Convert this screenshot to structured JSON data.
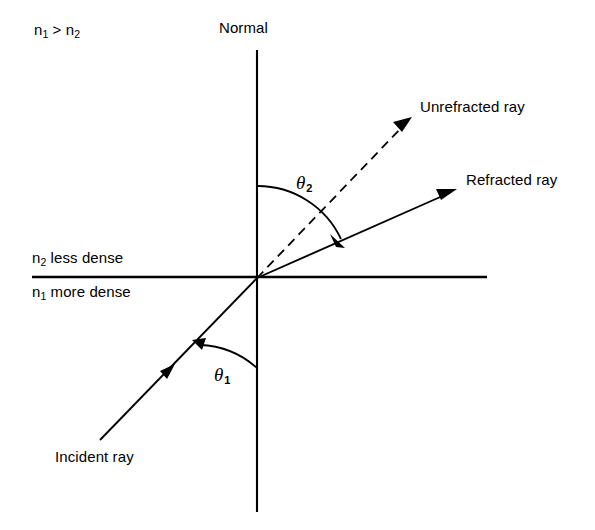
{
  "figure": {
    "background_color": "#ffffff",
    "stroke_color": "#000000",
    "width": 595,
    "height": 530
  },
  "labels": {
    "index_relation": "n₁ > n₂",
    "index_relation_base": "n",
    "index_relation_sub1": "1",
    "index_relation_middle": " > n",
    "index_relation_sub2": "2",
    "normal": "Normal",
    "upper_medium": "less dense",
    "upper_medium_symbol": "n",
    "upper_medium_sub": "2",
    "lower_medium": "more dense",
    "lower_medium_symbol": "n",
    "lower_medium_sub": "1",
    "unrefracted_ray": "Unrefracted ray",
    "refracted_ray": "Refracted ray",
    "incident_ray": "Incident ray",
    "theta2_symbol": "θ",
    "theta2_sub": "2",
    "theta1_symbol": "θ",
    "theta1_sub": "1"
  },
  "geometry": {
    "origin": {
      "x": 257,
      "y": 278
    },
    "normal_line": {
      "x1": 257,
      "y1": 50,
      "x2": 257,
      "y2": 512
    },
    "interface_line": {
      "x1": 32,
      "y1": 277,
      "x2": 487,
      "y2": 277
    },
    "incident_ray": {
      "x1": 100,
      "y1": 440,
      "x2": 257,
      "y2": 278,
      "style": "solid",
      "mid_arrow_at": {
        "x": 170,
        "y": 370
      }
    },
    "unrefracted_ray": {
      "x1": 257,
      "y1": 278,
      "x2": 412,
      "y2": 117,
      "style": "dashed",
      "angle_from_normal_deg": 44
    },
    "refracted_ray": {
      "x1": 257,
      "y1": 278,
      "x2": 457,
      "y2": 189,
      "style": "solid",
      "angle_from_normal_deg": 66
    },
    "theta2_arc": {
      "radius": 92,
      "start_deg": 90,
      "end_deg": 24,
      "arrow_end": {
        "x": 341,
        "y": 241
      }
    },
    "theta1_arc": {
      "radius": 90,
      "start_deg": 270,
      "end_deg": 225,
      "arrow_end": {
        "x": 194,
        "y": 340
      }
    }
  }
}
